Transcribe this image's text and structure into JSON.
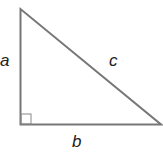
{
  "diagram": {
    "type": "right-triangle",
    "labels": {
      "a": "a",
      "b": "b",
      "c": "c"
    },
    "colors": {
      "stroke": "#777777",
      "text": "#222222",
      "background": "#ffffff"
    }
  }
}
